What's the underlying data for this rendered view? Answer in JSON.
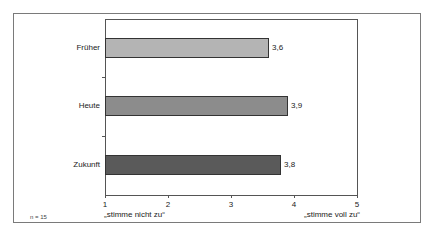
{
  "chart_data": {
    "type": "bar",
    "orientation": "horizontal",
    "title": "",
    "categories": [
      "Früher",
      "Heute",
      "Zukunft"
    ],
    "values": [
      3.6,
      3.9,
      3.8
    ],
    "value_labels": [
      "3,6",
      "3,9",
      "3,8"
    ],
    "colors": [
      "#b4b4b4",
      "#8c8c8c",
      "#5a5a5a"
    ],
    "xlabel": "",
    "ylabel": "",
    "xlim": [
      1,
      5
    ],
    "x_ticks": [
      "1",
      "2",
      "3",
      "4",
      "5"
    ],
    "scale_anchors": {
      "low": "„stimme nicht zu“",
      "high": "„stimme voll zu“"
    },
    "note": "n = 15",
    "grid": false,
    "legend": "none"
  }
}
